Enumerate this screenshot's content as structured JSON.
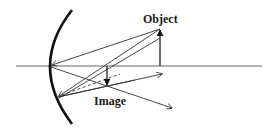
{
  "diagram": {
    "labels": {
      "object": "Object",
      "image": "Image"
    },
    "colors": {
      "mirror": "#111111",
      "rays": "#333333",
      "axis": "#666666",
      "background": "#ffffff"
    },
    "elements": {
      "mirror": {
        "type": "concave-mirror",
        "top": [
          72,
          10
        ],
        "vertex": [
          50,
          66
        ],
        "bottom": [
          72,
          124
        ]
      },
      "principal_axis": {
        "from": [
          16,
          66
        ],
        "to": [
          262,
          66
        ]
      },
      "object_arrow": {
        "x": 160,
        "base_y": 66,
        "tip_y": 29,
        "direction": "up"
      },
      "image_arrow": {
        "x": 107,
        "base_y": 66,
        "tip_y": 85,
        "direction": "down"
      }
    }
  }
}
